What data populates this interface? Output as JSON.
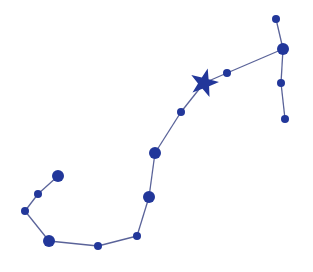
{
  "diagram": {
    "type": "constellation",
    "colors": {
      "star": "#22379a",
      "line": "#5a6399",
      "background": "#ffffff"
    },
    "brightest_star": {
      "x": 204,
      "y": 83,
      "outer_r": 15,
      "inner_r": 6,
      "shape": "star-icon"
    },
    "stars": [
      {
        "id": "s1",
        "x": 276,
        "y": 19,
        "r": 4
      },
      {
        "id": "s2",
        "x": 283,
        "y": 49,
        "r": 6
      },
      {
        "id": "s3",
        "x": 281,
        "y": 83,
        "r": 4
      },
      {
        "id": "s4",
        "x": 285,
        "y": 119,
        "r": 4
      },
      {
        "id": "s5",
        "x": 227,
        "y": 73,
        "r": 4
      },
      {
        "id": "s6",
        "x": 181,
        "y": 112,
        "r": 4
      },
      {
        "id": "s7",
        "x": 155,
        "y": 153,
        "r": 6
      },
      {
        "id": "s8",
        "x": 149,
        "y": 197,
        "r": 6
      },
      {
        "id": "s9",
        "x": 137,
        "y": 236,
        "r": 4
      },
      {
        "id": "s10",
        "x": 98,
        "y": 246,
        "r": 4
      },
      {
        "id": "s11",
        "x": 49,
        "y": 241,
        "r": 6
      },
      {
        "id": "s12",
        "x": 25,
        "y": 211,
        "r": 4
      },
      {
        "id": "s13",
        "x": 38,
        "y": 194,
        "r": 4
      },
      {
        "id": "s14",
        "x": 58,
        "y": 176,
        "r": 6
      }
    ],
    "edges": [
      [
        276,
        19,
        283,
        49
      ],
      [
        283,
        49,
        281,
        83
      ],
      [
        281,
        83,
        285,
        119
      ],
      [
        283,
        49,
        227,
        73
      ],
      [
        227,
        73,
        204,
        83
      ],
      [
        204,
        83,
        181,
        112
      ],
      [
        181,
        112,
        155,
        153
      ],
      [
        155,
        153,
        149,
        197
      ],
      [
        149,
        197,
        137,
        236
      ],
      [
        137,
        236,
        98,
        246
      ],
      [
        98,
        246,
        49,
        241
      ],
      [
        49,
        241,
        25,
        211
      ],
      [
        25,
        211,
        38,
        194
      ],
      [
        38,
        194,
        58,
        176
      ]
    ]
  }
}
